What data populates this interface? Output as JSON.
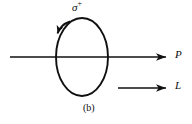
{
  "figure": {
    "caption": "(b)",
    "polarization_label": {
      "base": "σ",
      "superscript": "+",
      "full": "σ⁺"
    },
    "arrow_labels": {
      "momentum": "P",
      "angular_momentum": "L"
    },
    "stroke_color": "#101010",
    "background_color": "#ffffff",
    "ellipse": {
      "center_x": 82,
      "center_y": 57,
      "radius_x": 26,
      "radius_y": 39,
      "rotation_direction": "counterclockwise"
    },
    "axis_line": {
      "start_x": 10,
      "end_x": 168,
      "y": 57
    },
    "lower_arrow": {
      "start_x": 118,
      "end_x": 168,
      "y": 88
    }
  }
}
